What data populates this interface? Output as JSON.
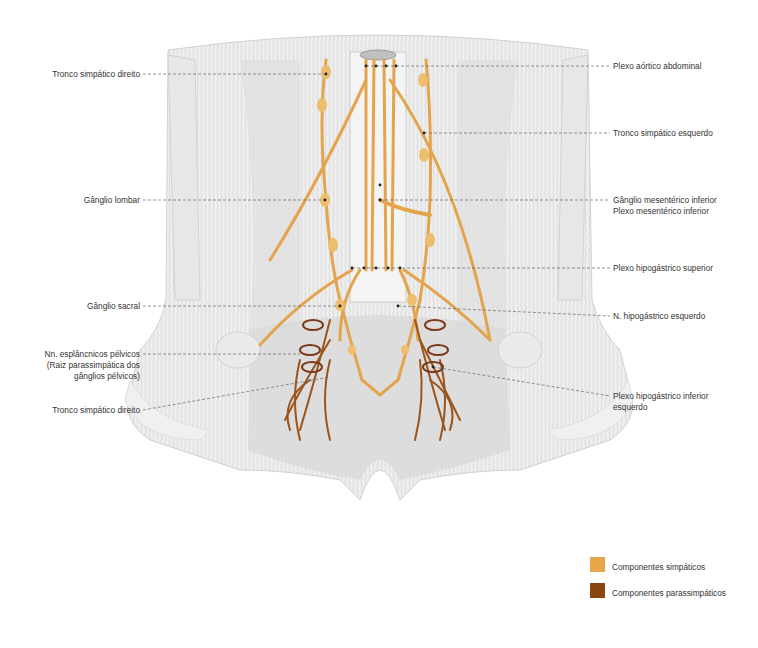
{
  "figure": {
    "labels_left": [
      {
        "id": "tronco-simpatico-direito-top",
        "text": "Tronco simpático direito"
      },
      {
        "id": "ganglio-lombar",
        "text": "Gânglio lombar"
      },
      {
        "id": "ganglio-sacral",
        "text": "Gânglio sacral"
      },
      {
        "id": "nn-esplancnicos-pelvicos",
        "lines": [
          "Nn. esplâncnicos pélvicos",
          "(Raiz parassimpática dos",
          "gânglios pélvicos)"
        ]
      },
      {
        "id": "tronco-simpatico-direito-bottom",
        "text": "Tronco simpático direito"
      }
    ],
    "labels_right": [
      {
        "id": "plexo-aortico-abdominal",
        "text": "Plexo aórtico abdominal"
      },
      {
        "id": "tronco-simpatico-esquerdo",
        "text": "Tronco simpático esquerdo"
      },
      {
        "id": "ganglio-mesenterico-inferior",
        "lines": [
          "Gânglio mesentérico inferior",
          "Plexo mesentérico inferior"
        ]
      },
      {
        "id": "plexo-hipogastrico-superior",
        "text": "Plexo hipogástrico superior"
      },
      {
        "id": "n-hipogastrico-esquerdo",
        "text": "N. hipogástrico esquerdo"
      },
      {
        "id": "plexo-hipogastrico-inferior-esquerdo",
        "lines": [
          "Plexo hipogástrico inferior",
          "esquerdo"
        ]
      }
    ]
  },
  "legend": {
    "items": [
      {
        "label": "Componentes simpáticos",
        "color": "#E8A64A"
      },
      {
        "label": "Componentes parassimpáticos",
        "color": "#8B4513"
      }
    ]
  },
  "colors": {
    "sympathetic": "#E3A44C",
    "parasympathetic": "#9A541C",
    "muscle": "#d9d9d9",
    "leader": "#555555"
  }
}
